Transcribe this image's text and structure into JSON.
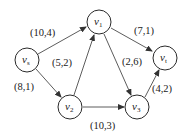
{
  "diagram": {
    "type": "directed-flow-network",
    "nodes": [
      {
        "id": "vs",
        "label": "v",
        "sub": "s",
        "x": 27,
        "y": 60
      },
      {
        "id": "v1",
        "label": "v",
        "sub": "1",
        "x": 99,
        "y": 22
      },
      {
        "id": "vt",
        "label": "v",
        "sub": "t",
        "x": 165,
        "y": 58
      },
      {
        "id": "v2",
        "label": "v",
        "sub": "2",
        "x": 70,
        "y": 107
      },
      {
        "id": "v3",
        "label": "v",
        "sub": "3",
        "x": 137,
        "y": 107
      }
    ],
    "edges": [
      {
        "from": "vs",
        "to": "v1",
        "label": "(10,4)"
      },
      {
        "from": "vs",
        "to": "v2",
        "label": "(8,1)"
      },
      {
        "from": "v2",
        "to": "v1",
        "label": "(5,2)"
      },
      {
        "from": "v1",
        "to": "vt",
        "label": "(7,1)"
      },
      {
        "from": "v1",
        "to": "v3",
        "label": "(2,6)"
      },
      {
        "from": "v2",
        "to": "v3",
        "label": "(10,3)"
      },
      {
        "from": "v3",
        "to": "vt",
        "label": "(4,2)"
      }
    ]
  }
}
